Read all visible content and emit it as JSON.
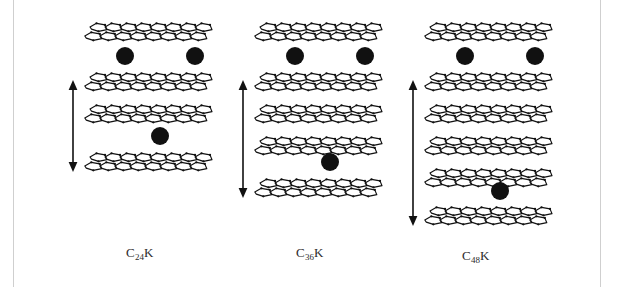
{
  "figure": {
    "type": "stage-structure-diagram",
    "background_color": "#ffffff",
    "frame_color": "#cfcfcf",
    "sheet_color": "#111111",
    "atom_color": "#111111",
    "arrow_color": "#111111"
  },
  "columns": [
    {
      "id": "stage-2",
      "caption_prefix": "C",
      "caption_subscript": "24",
      "caption_suffix": "K",
      "caption_full": "C24K",
      "stage_number": 2,
      "graphene_layer_count": 4,
      "sheet_y": [
        22,
        72,
        104,
        152
      ],
      "atoms": [
        {
          "label": "potassium-atom",
          "x": 36,
          "y": 47
        },
        {
          "label": "potassium-atom",
          "x": 106,
          "y": 47
        },
        {
          "label": "potassium-atom",
          "x": 71,
          "y": 127
        }
      ],
      "arrow": {
        "label": "repeat-distance-arrow",
        "top": 80,
        "bottom": 172
      }
    },
    {
      "id": "stage-3",
      "caption_prefix": "C",
      "caption_subscript": "36",
      "caption_suffix": "K",
      "caption_full": "C36K",
      "stage_number": 3,
      "graphene_layer_count": 5,
      "sheet_y": [
        22,
        72,
        104,
        136,
        178
      ],
      "atoms": [
        {
          "label": "potassium-atom",
          "x": 36,
          "y": 47
        },
        {
          "label": "potassium-atom",
          "x": 106,
          "y": 47
        },
        {
          "label": "potassium-atom",
          "x": 71,
          "y": 153
        }
      ],
      "arrow": {
        "label": "repeat-distance-arrow",
        "top": 80,
        "bottom": 198
      }
    },
    {
      "id": "stage-4",
      "caption_prefix": "C",
      "caption_subscript": "48",
      "caption_suffix": "K",
      "caption_full": "C48K",
      "stage_number": 4,
      "graphene_layer_count": 6,
      "sheet_y": [
        22,
        72,
        104,
        136,
        168,
        206
      ],
      "atoms": [
        {
          "label": "potassium-atom",
          "x": 36,
          "y": 47
        },
        {
          "label": "potassium-atom",
          "x": 106,
          "y": 47
        },
        {
          "label": "potassium-atom",
          "x": 71,
          "y": 182
        }
      ],
      "arrow": {
        "label": "repeat-distance-arrow",
        "top": 80,
        "bottom": 226
      }
    }
  ],
  "column_layout": [
    {
      "left": 80,
      "caption_left": 126,
      "caption_top": 245
    },
    {
      "left": 250,
      "caption_left": 296,
      "caption_top": 245
    },
    {
      "left": 420,
      "caption_left": 462,
      "caption_top": 248
    }
  ]
}
